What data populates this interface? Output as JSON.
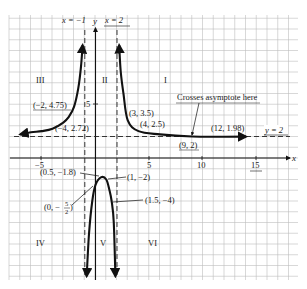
{
  "chart_data": {
    "type": "line",
    "title": "",
    "xlabel": "x",
    "ylabel": "y",
    "xlim": [
      -8,
      19
    ],
    "ylim": [
      -11.5,
      13
    ],
    "grid": true,
    "x_ticks": [
      {
        "value": -5,
        "label": "-5"
      },
      {
        "value": 5,
        "label": "5"
      },
      {
        "value": 10,
        "label": "10"
      },
      {
        "value": 15,
        "label": "15"
      }
    ],
    "y_ticks": [
      {
        "value": 5,
        "label": "5"
      }
    ],
    "asymptotes": [
      {
        "type": "vertical",
        "value": -1,
        "label": "x = -1"
      },
      {
        "type": "vertical",
        "value": 2,
        "label": "x = 2"
      },
      {
        "type": "horizontal",
        "value": 2,
        "label": "y = 2"
      }
    ],
    "regions": [
      {
        "label": "III",
        "x": -5.5,
        "y": 7
      },
      {
        "label": "II",
        "x": 0.8,
        "y": 7
      },
      {
        "label": "I",
        "x": 7.5,
        "y": 7
      },
      {
        "label": "IV",
        "x": -5.5,
        "y": -8.5
      },
      {
        "label": "V",
        "x": 0.5,
        "y": -8.5
      },
      {
        "label": "VI",
        "x": 4.5,
        "y": -8.5
      }
    ],
    "series": [
      {
        "name": "branch-left",
        "points": [
          [
            -7,
            2.2
          ],
          [
            -6,
            2.4
          ],
          [
            -5,
            2.5
          ],
          [
            -4,
            2.72
          ],
          [
            -3,
            3.3
          ],
          [
            -2.5,
            3.8
          ],
          [
            -2,
            4.75
          ],
          [
            -1.6,
            6.5
          ],
          [
            -1.35,
            8.5
          ],
          [
            -1.2,
            10.5
          ]
        ]
      },
      {
        "name": "branch-middle",
        "points": [
          [
            -0.82,
            -11
          ],
          [
            -0.6,
            -7
          ],
          [
            -0.3,
            -4
          ],
          [
            0,
            -2.5
          ],
          [
            0.5,
            -1.8
          ],
          [
            1,
            -2
          ],
          [
            1.3,
            -3
          ],
          [
            1.5,
            -4
          ],
          [
            1.7,
            -6
          ],
          [
            1.85,
            -11
          ]
        ]
      },
      {
        "name": "branch-right",
        "points": [
          [
            2.2,
            10.5
          ],
          [
            2.35,
            8
          ],
          [
            2.6,
            6
          ],
          [
            3,
            3.5
          ],
          [
            4,
            2.5
          ],
          [
            6,
            2.2
          ],
          [
            9,
            2
          ],
          [
            12,
            1.98
          ],
          [
            14,
            1.99
          ]
        ]
      }
    ],
    "annotations": [
      {
        "text": "(-2, 4.75)",
        "x": -2,
        "y": 4.75
      },
      {
        "text": "(-4, 2.72)",
        "x": -4,
        "y": 2.72
      },
      {
        "text": "(3, 3.5)",
        "x": 3,
        "y": 3.5
      },
      {
        "text": "(4, 2.5)",
        "x": 4,
        "y": 2.5
      },
      {
        "text": "(9, 2)",
        "x": 9,
        "y": 2
      },
      {
        "text": "(12, 1.98)",
        "x": 12,
        "y": 1.98
      },
      {
        "text": "Crosses asymptote here",
        "x": 9,
        "y": 2
      },
      {
        "text": "(0.5, -1.8)",
        "x": 0.5,
        "y": -1.8
      },
      {
        "text": "(1, -2)",
        "x": 1,
        "y": -2
      },
      {
        "text": "(0, -5/2)",
        "x": 0,
        "y": -2.5
      },
      {
        "text": "(1.5, -4)",
        "x": 1.5,
        "y": -4
      }
    ]
  },
  "labels": {
    "x_axis": "x",
    "y_axis": "y",
    "asym_left": "x = −1",
    "asym_right": "x = 2",
    "asym_horizontal": "y = 2",
    "tick_neg5": "−5",
    "tick_5": "5",
    "tick_10": "10",
    "tick_15": "15",
    "tick_y5": "5",
    "region_I": "I",
    "region_II": "II",
    "region_III": "III",
    "region_IV": "IV",
    "region_V": "V",
    "region_VI": "VI",
    "pt_m2_475": "(−2, 4.75)",
    "pt_m4_272": "(−4, 2.72)",
    "pt_3_35": "(3, 3.5)",
    "pt_4_25": "(4, 2.5)",
    "pt_9_2": "(9, 2)",
    "pt_12_198": "(12, 1.98)",
    "crosses": "Crosses asymptote here",
    "pt_05_m18": "(0.5, −1.8)",
    "pt_1_m2": "(1, −2)",
    "pt_0_a": "(0, −",
    "pt_0_num": "5",
    "pt_0_den": "2",
    "pt_0_b": ")",
    "pt_15_m4": "(1.5, −4)"
  }
}
